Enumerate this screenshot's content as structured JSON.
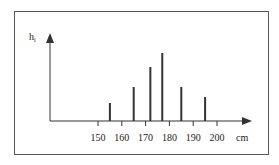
{
  "chart_data": {
    "type": "bar",
    "title": "",
    "xlabel": "cm",
    "ylabel": "h_i",
    "ylabel_main": "h",
    "ylabel_sub": "i",
    "x_ticks": [
      150,
      160,
      170,
      180,
      190,
      200
    ],
    "x_tick_labels": [
      "150",
      "160",
      "170",
      "180",
      "190",
      "200"
    ],
    "x": [
      155,
      165,
      172,
      177,
      185,
      195
    ],
    "values": [
      18,
      34,
      54,
      68,
      34,
      24
    ],
    "value_units": "relative (no y-axis scale shown)",
    "xlim": [
      140,
      212
    ],
    "ylim": [
      0,
      80
    ],
    "grid": false,
    "legend": null
  },
  "colors": {
    "bars": "#333333",
    "axes": "#333333",
    "frame": "#555555",
    "background": "#ffffff"
  }
}
